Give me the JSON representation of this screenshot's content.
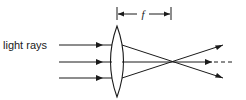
{
  "diagram": {
    "labels": {
      "light_rays": "light rays",
      "focal_length": "f"
    },
    "rays": {
      "count": 3,
      "direction": "left-to-right",
      "converge_at": "focal point"
    },
    "colors": {
      "stroke": "#1a1a1a",
      "background": "#ffffff"
    }
  }
}
